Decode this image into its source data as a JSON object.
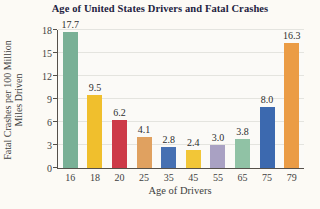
{
  "title": "Age of United States Drivers and Fatal Crashes",
  "chart_data": {
    "type": "bar",
    "title": "Age of United States Drivers and Fatal Crashes",
    "xlabel": "Age of Drivers",
    "ylabel": "Fatal Crashes per 100 Million Miles Driven",
    "ylabel_lines": [
      "Fatal Crashes per 100 Million",
      "Miles Driven"
    ],
    "categories": [
      "16",
      "18",
      "20",
      "25",
      "35",
      "45",
      "55",
      "65",
      "75",
      "79"
    ],
    "values": [
      17.7,
      9.5,
      6.2,
      4.1,
      2.8,
      2.4,
      3.0,
      3.8,
      8.0,
      16.3
    ],
    "value_labels": [
      "17.7",
      "9.5",
      "6.2",
      "4.1",
      "2.8",
      "2.4",
      "3.0",
      "3.8",
      "8.0",
      "16.3"
    ],
    "bar_colors": [
      "#79b096",
      "#f0bf2d",
      "#cd3a48",
      "#e0a160",
      "#4670b2",
      "#f2c637",
      "#a9a1c3",
      "#90c2a5",
      "#3c69af",
      "#eb9c45"
    ],
    "yticks": [
      0,
      3,
      6,
      9,
      12,
      15,
      18
    ],
    "ylim": [
      0,
      18
    ],
    "grid": true,
    "legend": "none",
    "colors": {
      "title_text": "#23233f",
      "axis_text": "#3f3f3f",
      "grid_line": "#e4e4df",
      "axis_line": "#55504a",
      "background": "#fcfaf5"
    }
  }
}
